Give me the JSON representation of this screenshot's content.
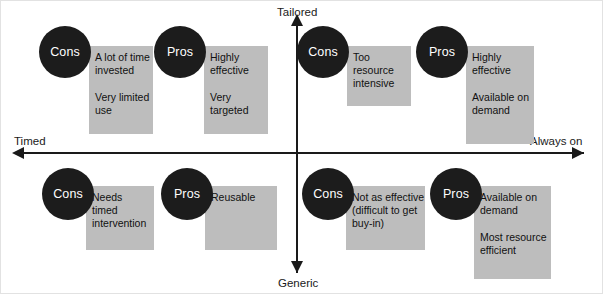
{
  "diagram": {
    "title_axes": {
      "top": "Tailored",
      "bottom": "Generic",
      "left": "Timed",
      "right": "Always on"
    },
    "colors": {
      "box_fill": "#bdbdbd",
      "badge_fill": "#1c1c1c",
      "badge_text": "#ffffff",
      "axis": "#1a1a1a",
      "body_text": "#111111",
      "background": "#ffffff"
    },
    "quadrants": [
      {
        "name": "timed-tailored",
        "position": "top-left",
        "cells": [
          {
            "badge": "Cons",
            "text": "A lot of time\ninvested\n\nVery limited\nuse"
          },
          {
            "badge": "Pros",
            "text": "Highly\neffective\n\nVery\ntargeted"
          }
        ]
      },
      {
        "name": "always-on-tailored",
        "position": "top-right",
        "cells": [
          {
            "badge": "Cons",
            "text": "Too\nresource\nintensive"
          },
          {
            "badge": "Pros",
            "text": "Highly\neffective\n\nAvailable on\ndemand"
          }
        ]
      },
      {
        "name": "timed-generic",
        "position": "bottom-left",
        "cells": [
          {
            "badge": "Cons",
            "text": "Needs\ntimed\nintervention"
          },
          {
            "badge": "Pros",
            "text": "Reusable"
          }
        ]
      },
      {
        "name": "always-on-generic",
        "position": "bottom-right",
        "cells": [
          {
            "badge": "Cons",
            "text": "Not as effective\n(difficult to get\nbuy-in)"
          },
          {
            "badge": "Pros",
            "text": "Available on\ndemand\n\nMost resource\nefficient"
          }
        ]
      }
    ]
  }
}
